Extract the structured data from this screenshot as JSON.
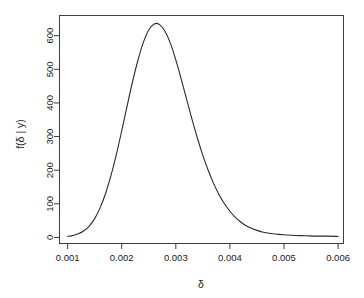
{
  "chart_data": {
    "type": "line",
    "title": "",
    "subtitle": "",
    "xlabel": "δ",
    "ylabel": "f(δ | y)",
    "grid": false,
    "legend": "none",
    "xlim": [
      0.00085,
      0.0061
    ],
    "ylim": [
      -18,
      660
    ],
    "xticks": [
      0.001,
      0.002,
      0.003,
      0.004,
      0.005,
      0.006
    ],
    "xtick_labels": [
      "0.001",
      "0.002",
      "0.003",
      "0.004",
      "0.005",
      "0.006"
    ],
    "yticks": [
      0,
      100,
      200,
      300,
      400,
      500,
      600
    ],
    "ytick_labels": [
      "0",
      "100",
      "200",
      "300",
      "400",
      "500",
      "600"
    ],
    "series": [
      {
        "name": "posterior density",
        "color": "#2b2b2b",
        "x": [
          0.001,
          0.0011,
          0.0012,
          0.0013,
          0.0014,
          0.0015,
          0.0016,
          0.0017,
          0.0018,
          0.0019,
          0.002,
          0.0021,
          0.0022,
          0.0023,
          0.0024,
          0.0025,
          0.0026,
          0.0027,
          0.0028,
          0.0029,
          0.003,
          0.0031,
          0.0032,
          0.0033,
          0.0034,
          0.0035,
          0.0036,
          0.0037,
          0.0038,
          0.0039,
          0.004,
          0.0041,
          0.0042,
          0.0043,
          0.0044,
          0.0045,
          0.0046,
          0.0047,
          0.0048,
          0.0049,
          0.005,
          0.0052,
          0.0054,
          0.0056,
          0.0058,
          0.006
        ],
        "y": [
          3,
          6,
          11,
          20,
          34,
          56,
          88,
          130,
          183,
          246,
          317,
          391,
          463,
          527,
          580,
          617,
          635,
          633,
          613,
          577,
          528,
          471,
          411,
          351,
          295,
          244,
          199,
          160,
          127,
          100,
          78,
          60,
          46,
          35,
          27,
          21,
          16,
          13,
          11,
          9,
          8,
          6,
          5,
          4,
          4,
          3
        ]
      }
    ],
    "annotations": {
      "peak_x": 0.0026,
      "peak_y": 635
    }
  },
  "axes": {
    "x_title": "δ",
    "y_title": "f(δ | y)"
  }
}
